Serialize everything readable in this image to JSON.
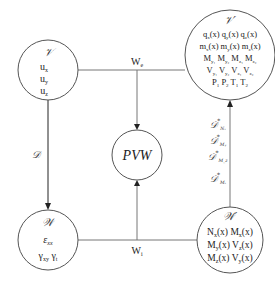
{
  "nodes": {
    "V": {
      "title": "𝒱",
      "items": [
        "u",
        "u",
        "u"
      ],
      "subs": [
        "x",
        "y",
        "z"
      ]
    },
    "Vprime": {
      "title": "𝒱′",
      "rows": [
        [
          "q",
          "(x) q",
          "(x) q",
          "(x)"
        ],
        [
          "m",
          "(x)  m",
          "(x)  m",
          "(x)"
        ]
      ],
      "row1_subs": [
        "x",
        "y",
        "z"
      ],
      "row2_subs": [
        "x",
        "y",
        "z"
      ],
      "row3": [
        "M",
        "M",
        "M",
        "M"
      ],
      "row3_subs": [
        "y₁",
        "y₂",
        "z₁",
        "z₂"
      ],
      "row4": [
        "V",
        "V",
        "V",
        "V"
      ],
      "row4_subs": [
        "y₁",
        "y₂",
        "z₁",
        "z₂"
      ],
      "row5": [
        "P",
        "P",
        "T",
        "T"
      ],
      "row5_subs": [
        "1",
        "2",
        "1",
        "2"
      ]
    },
    "PVW": {
      "label": "PVW"
    },
    "W": {
      "title": "𝒲",
      "strain": "ε",
      "strain_sub": "xx",
      "gamma1": "γ",
      "gamma1_sub": "xy",
      "gamma2": "γ",
      "gamma2_sub": "t"
    },
    "Wprime": {
      "title": "𝒲′",
      "rows": [
        [
          "N",
          "x",
          "(x) M",
          "x",
          "(x)"
        ],
        [
          "M",
          "y",
          "(x) V",
          "z",
          "(x)"
        ],
        [
          "M",
          "z",
          "(x)  V",
          "y",
          "(x)"
        ]
      ]
    }
  },
  "edges": {
    "We": {
      "label": "W",
      "sub": "e"
    },
    "Wi": {
      "label": "W",
      "sub": "i"
    },
    "D": {
      "label": "𝒟"
    },
    "Dstar": [
      {
        "label": "𝒟",
        "sup": "*",
        "sub": "Nₓ"
      },
      {
        "label": "𝒟",
        "sup": "*",
        "sub": "Mᵧ"
      },
      {
        "label": "𝒟",
        "sup": "*",
        "sub": "M_z"
      },
      {
        "label": "𝒟",
        "sup": "*",
        "sub": "Mₓ"
      }
    ]
  }
}
